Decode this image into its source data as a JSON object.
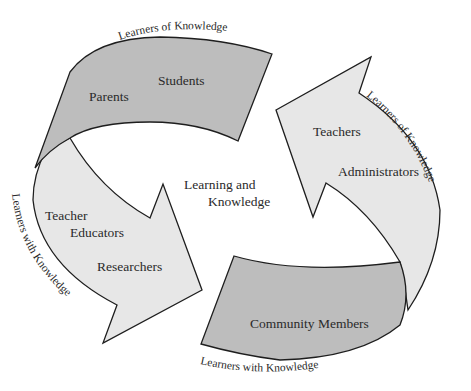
{
  "diagram": {
    "center_label": {
      "line1": "Learning and",
      "line2": "Knowledge"
    },
    "segments": [
      {
        "id": "top",
        "fill": "#bdbdbd",
        "labels": [
          "Parents",
          "Students"
        ],
        "arc_label": "Learners of Knowledge"
      },
      {
        "id": "right",
        "fill": "#e7e7e7",
        "labels": [
          "Teachers",
          "Administrators"
        ],
        "arc_label": "Learners of Knowledge"
      },
      {
        "id": "bottom",
        "fill": "#bdbdbd",
        "labels": [
          "Community Members"
        ],
        "arc_label": "Learners with Knowledge"
      },
      {
        "id": "left",
        "fill": "#e7e7e7",
        "labels": [
          "Teacher",
          "Educators",
          "Researchers"
        ],
        "arc_label": "Learners with Knowledge"
      }
    ]
  }
}
